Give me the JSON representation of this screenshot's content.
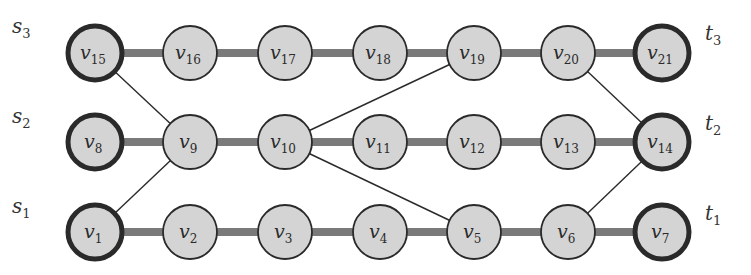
{
  "diagram": {
    "type": "graph",
    "node_radius": 28,
    "colors": {
      "node_fill": "#d4d4d4",
      "node_stroke": "#2a2a2a",
      "thick_edge": "#7a7a7a",
      "thin_edge": "#2a2a2a",
      "background": "#ffffff"
    },
    "nodes": [
      {
        "id": "v1",
        "label": "v",
        "sub": "1",
        "x": 95,
        "y": 232,
        "terminal": true
      },
      {
        "id": "v2",
        "label": "v",
        "sub": "2",
        "x": 190,
        "y": 232,
        "terminal": false
      },
      {
        "id": "v3",
        "label": "v",
        "sub": "3",
        "x": 285,
        "y": 232,
        "terminal": false
      },
      {
        "id": "v4",
        "label": "v",
        "sub": "4",
        "x": 380,
        "y": 232,
        "terminal": false
      },
      {
        "id": "v5",
        "label": "v",
        "sub": "5",
        "x": 474,
        "y": 232,
        "terminal": false
      },
      {
        "id": "v6",
        "label": "v",
        "sub": "6",
        "x": 568,
        "y": 232,
        "terminal": false
      },
      {
        "id": "v7",
        "label": "v",
        "sub": "7",
        "x": 662,
        "y": 232,
        "terminal": true
      },
      {
        "id": "v8",
        "label": "v",
        "sub": "8",
        "x": 95,
        "y": 142,
        "terminal": true
      },
      {
        "id": "v9",
        "label": "v",
        "sub": "9",
        "x": 190,
        "y": 142,
        "terminal": false
      },
      {
        "id": "v10",
        "label": "v",
        "sub": "10",
        "x": 285,
        "y": 142,
        "terminal": false
      },
      {
        "id": "v11",
        "label": "v",
        "sub": "11",
        "x": 380,
        "y": 142,
        "terminal": false
      },
      {
        "id": "v12",
        "label": "v",
        "sub": "12",
        "x": 474,
        "y": 142,
        "terminal": false
      },
      {
        "id": "v13",
        "label": "v",
        "sub": "13",
        "x": 568,
        "y": 142,
        "terminal": false
      },
      {
        "id": "v14",
        "label": "v",
        "sub": "14",
        "x": 662,
        "y": 142,
        "terminal": true
      },
      {
        "id": "v15",
        "label": "v",
        "sub": "15",
        "x": 95,
        "y": 53,
        "terminal": true
      },
      {
        "id": "v16",
        "label": "v",
        "sub": "16",
        "x": 190,
        "y": 53,
        "terminal": false
      },
      {
        "id": "v17",
        "label": "v",
        "sub": "17",
        "x": 285,
        "y": 53,
        "terminal": false
      },
      {
        "id": "v18",
        "label": "v",
        "sub": "18",
        "x": 380,
        "y": 53,
        "terminal": false
      },
      {
        "id": "v19",
        "label": "v",
        "sub": "19",
        "x": 474,
        "y": 53,
        "terminal": false
      },
      {
        "id": "v20",
        "label": "v",
        "sub": "20",
        "x": 568,
        "y": 53,
        "terminal": false
      },
      {
        "id": "v21",
        "label": "v",
        "sub": "21",
        "x": 662,
        "y": 53,
        "terminal": true
      }
    ],
    "thick_edges": [
      [
        "v1",
        "v2"
      ],
      [
        "v2",
        "v3"
      ],
      [
        "v3",
        "v4"
      ],
      [
        "v4",
        "v5"
      ],
      [
        "v5",
        "v6"
      ],
      [
        "v6",
        "v7"
      ],
      [
        "v8",
        "v9"
      ],
      [
        "v9",
        "v10"
      ],
      [
        "v10",
        "v11"
      ],
      [
        "v11",
        "v12"
      ],
      [
        "v12",
        "v13"
      ],
      [
        "v13",
        "v14"
      ],
      [
        "v15",
        "v16"
      ],
      [
        "v16",
        "v17"
      ],
      [
        "v17",
        "v18"
      ],
      [
        "v18",
        "v19"
      ],
      [
        "v19",
        "v20"
      ],
      [
        "v20",
        "v21"
      ]
    ],
    "thin_edges": [
      [
        "v15",
        "v9"
      ],
      [
        "v9",
        "v1"
      ],
      [
        "v10",
        "v19"
      ],
      [
        "v10",
        "v5"
      ],
      [
        "v20",
        "v14"
      ],
      [
        "v6",
        "v14"
      ]
    ],
    "side_labels": [
      {
        "id": "s3",
        "label": "s",
        "sub": "3",
        "x": 12,
        "y": 33
      },
      {
        "id": "s2",
        "label": "s",
        "sub": "2",
        "x": 12,
        "y": 123
      },
      {
        "id": "s1",
        "label": "s",
        "sub": "1",
        "x": 12,
        "y": 213
      },
      {
        "id": "t3",
        "label": "t",
        "sub": "3",
        "x": 705,
        "y": 40
      },
      {
        "id": "t2",
        "label": "t",
        "sub": "2",
        "x": 705,
        "y": 130
      },
      {
        "id": "t1",
        "label": "t",
        "sub": "1",
        "x": 705,
        "y": 220
      }
    ]
  }
}
